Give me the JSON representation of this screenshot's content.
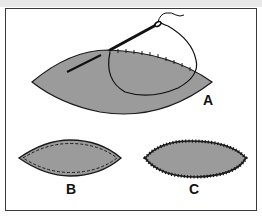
{
  "figure": {
    "colors": {
      "fabric_fill": "#9b9b9b",
      "outline": "#1a1a1a",
      "frame": "#3a3a3a",
      "background": "#ffffff"
    },
    "panels": [
      {
        "id": "A",
        "label": "A",
        "caption": "Needle and thread whipstitching the edge of the fabric"
      },
      {
        "id": "B",
        "label": "B",
        "caption": "Finished piece with running stitch along the edge"
      },
      {
        "id": "C",
        "label": "C",
        "caption": "Finished piece with overcast/blanket stitch around the edge"
      }
    ]
  }
}
